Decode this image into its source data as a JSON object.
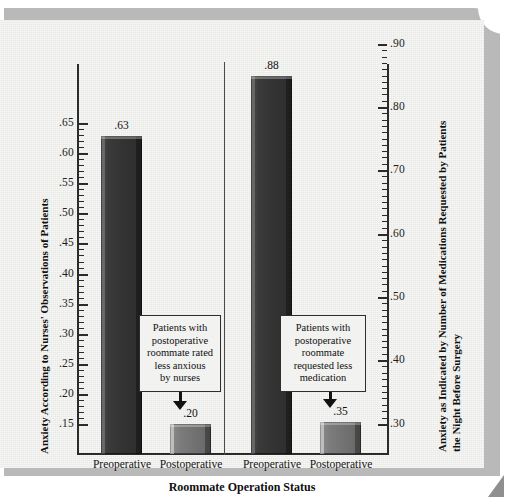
{
  "chart_data": {
    "type": "bar",
    "title": "",
    "xlabel": "Roommate Operation Status",
    "categories": [
      "Preoperative",
      "Postoperative",
      "Preoperative",
      "Postoperative"
    ],
    "panels": [
      {
        "name": "Anxiety According to Nurses' Observations of Patients",
        "axis": "left",
        "categories": [
          "Preoperative",
          "Postoperative"
        ],
        "values": [
          0.63,
          0.2
        ],
        "value_labels": [
          ".63",
          ".20"
        ],
        "ylim": [
          0.15,
          0.65
        ],
        "ytick_labels": [
          ".65",
          ".60",
          ".55",
          ".50",
          ".45",
          ".40",
          ".35",
          ".30",
          ".25",
          ".20",
          ".15"
        ],
        "ytick_values": [
          0.65,
          0.6,
          0.55,
          0.5,
          0.45,
          0.4,
          0.35,
          0.3,
          0.25,
          0.2,
          0.15
        ],
        "annotation": [
          "Patients with",
          "postoperative",
          "roommate rated",
          "less anxious",
          "by nurses"
        ]
      },
      {
        "name": "Anxiety as Indicated by Number of Medications Requested by Patients the Night Before Surgery",
        "axis": "right",
        "categories": [
          "Preoperative",
          "Postoperative"
        ],
        "values": [
          0.88,
          0.35
        ],
        "value_labels": [
          ".88",
          ".35"
        ],
        "ylim": [
          0.3,
          0.9
        ],
        "ytick_labels": [
          ".90",
          ".80",
          ".70",
          ".60",
          ".50",
          ".40",
          ".30"
        ],
        "ytick_values": [
          0.9,
          0.8,
          0.7,
          0.6,
          0.5,
          0.4,
          0.3
        ],
        "annotation": [
          "Patients with",
          "postoperative",
          "roommate",
          "requested less",
          "medication"
        ]
      }
    ],
    "ylabel_left": "Anxiety According to Nurses' Observations of Patients",
    "ylabel_right_line1": "Anxiety as Indicated by Number of Medications Requested by Patients",
    "ylabel_right_line2": "the Night Before Surgery",
    "grid": false,
    "legend": "none",
    "colors": {
      "bar_dark": "#333333",
      "bar_light": "#6f6f6f",
      "axis": "#2b2b2b",
      "paper": "#ededea",
      "frame": "#b9b9b9"
    }
  },
  "axes": {
    "left_ticks": [
      {
        "label": ".65",
        "top": 103
      },
      {
        "label": ".60",
        "top": 133
      },
      {
        "label": ".55",
        "top": 163
      },
      {
        "label": ".50",
        "top": 193
      },
      {
        "label": ".45",
        "top": 223
      },
      {
        "label": ".40",
        "top": 254
      },
      {
        "label": ".35",
        "top": 284
      },
      {
        "label": ".30",
        "top": 314
      },
      {
        "label": ".25",
        "top": 344
      },
      {
        "label": ".20",
        "top": 374
      },
      {
        "label": ".15",
        "top": 404
      }
    ],
    "right_ticks": [
      {
        "label": ".90",
        "top": 24
      },
      {
        "label": ".80",
        "top": 87
      },
      {
        "label": ".70",
        "top": 150
      },
      {
        "label": ".60",
        "top": 214
      },
      {
        "label": ".50",
        "top": 277
      },
      {
        "label": ".40",
        "top": 340
      },
      {
        "label": ".30",
        "top": 404
      }
    ]
  },
  "bars": [
    {
      "id": "bar-pre-nurses",
      "value_label": ".63",
      "left": 101,
      "top": 116,
      "width": 41,
      "height": 318,
      "tone": "dark",
      "label_left": 94,
      "label_top": 99
    },
    {
      "id": "bar-post-nurses",
      "value_label": ".20",
      "left": 170,
      "top": 404,
      "width": 41,
      "height": 30,
      "tone": "light",
      "label_left": 163,
      "label_top": 387
    },
    {
      "id": "bar-pre-meds",
      "value_label": ".88",
      "left": 251,
      "top": 56,
      "width": 41,
      "height": 378,
      "tone": "dark",
      "label_left": 244,
      "label_top": 39
    },
    {
      "id": "bar-post-meds",
      "value_label": ".35",
      "left": 320,
      "top": 402,
      "width": 41,
      "height": 32,
      "tone": "light",
      "label_left": 313,
      "label_top": 385
    }
  ],
  "xlabels": [
    {
      "text": "Preoperative",
      "left": 78,
      "width": 88
    },
    {
      "text": "Postoperative",
      "left": 147,
      "width": 88
    },
    {
      "text": "Preoperative",
      "left": 228,
      "width": 88
    },
    {
      "text": "Postoperative",
      "left": 297,
      "width": 88
    }
  ]
}
